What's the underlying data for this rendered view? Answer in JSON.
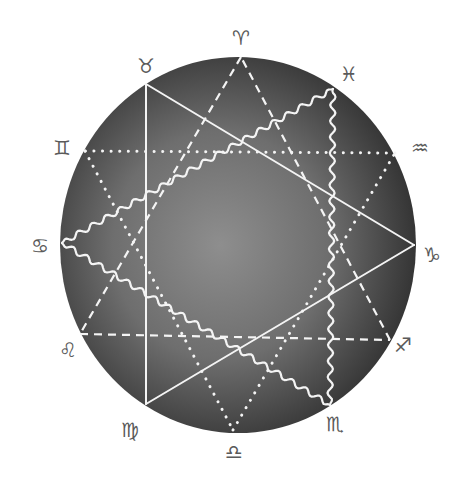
{
  "diagram": {
    "type": "zodiac-trigon-figure",
    "circle": {
      "cx": 238,
      "cy": 245,
      "rx": 178,
      "ry": 188,
      "center_color": "#8e8e8e",
      "edge_color": "#353535"
    },
    "line_color": "#f4f4f4",
    "signs": [
      {
        "key": "aries",
        "glyph": "♈",
        "x": 241,
        "y": 38
      },
      {
        "key": "taurus",
        "glyph": "♉",
        "x": 146,
        "y": 66
      },
      {
        "key": "gemini",
        "glyph": "♊",
        "x": 62,
        "y": 148
      },
      {
        "key": "cancer",
        "glyph": "♋",
        "x": 40,
        "y": 246
      },
      {
        "key": "leo",
        "glyph": "♌",
        "x": 68,
        "y": 350
      },
      {
        "key": "virgo",
        "glyph": "♍",
        "x": 130,
        "y": 430
      },
      {
        "key": "libra",
        "glyph": "♎",
        "x": 234,
        "y": 452
      },
      {
        "key": "scorpio",
        "glyph": "♏",
        "x": 335,
        "y": 424
      },
      {
        "key": "sagittarius",
        "glyph": "♐",
        "x": 403,
        "y": 345
      },
      {
        "key": "capricorn",
        "glyph": "♑",
        "x": 432,
        "y": 255
      },
      {
        "key": "aquarius",
        "glyph": "♒",
        "x": 420,
        "y": 148
      },
      {
        "key": "pisces",
        "glyph": "♓",
        "x": 349,
        "y": 74
      }
    ],
    "triangles": [
      {
        "name": "dashed-triangle",
        "style": "dashed",
        "signs": [
          "aries",
          "leo",
          "sagittarius"
        ],
        "points": [
          [
            241,
            57
          ],
          [
            80,
            334
          ],
          [
            390,
            340
          ]
        ]
      },
      {
        "name": "solid-triangle",
        "style": "solid",
        "signs": [
          "taurus",
          "virgo",
          "capricorn"
        ],
        "points": [
          [
            146,
            84
          ],
          [
            146,
            404
          ],
          [
            414,
            245
          ]
        ]
      },
      {
        "name": "dotted-triangle",
        "style": "dotted",
        "signs": [
          "gemini",
          "libra",
          "aquarius"
        ],
        "points": [
          [
            85,
            151
          ],
          [
            233,
            430
          ],
          [
            395,
            153
          ]
        ]
      },
      {
        "name": "wavy-triangle",
        "style": "wavy",
        "signs": [
          "cancer",
          "scorpio",
          "pisces"
        ],
        "points": [
          [
            62,
            243
          ],
          [
            330,
            405
          ],
          [
            333,
            89
          ]
        ]
      }
    ]
  }
}
